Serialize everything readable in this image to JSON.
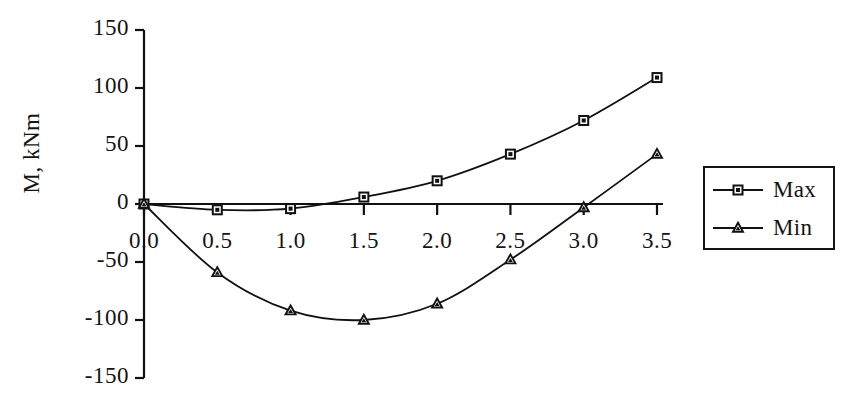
{
  "chart_data": {
    "type": "line",
    "title": "",
    "xlabel": "",
    "ylabel": "M, kNm",
    "x": [
      0.0,
      0.5,
      1.0,
      1.5,
      2.0,
      2.5,
      3.0,
      3.5
    ],
    "xtick_labels": [
      "0.0",
      "0.5",
      "1.0",
      "1.5",
      "2.0",
      "2.5",
      "3.0",
      "3.5"
    ],
    "ytick_labels": [
      "150",
      "100",
      "50",
      "0",
      "-50",
      "-100",
      "-150"
    ],
    "ytick_values": [
      150,
      100,
      50,
      0,
      -50,
      -100,
      -150
    ],
    "xlim": [
      0.0,
      3.5
    ],
    "ylim": [
      -150,
      150
    ],
    "grid": false,
    "legend_position": "right",
    "series": [
      {
        "name": "Max",
        "marker": "square",
        "color": "#111111",
        "values": [
          0,
          -5,
          -4,
          6,
          20,
          43,
          72,
          109
        ]
      },
      {
        "name": "Min",
        "marker": "triangle",
        "color": "#111111",
        "values": [
          0,
          -59,
          -92,
          -100,
          -86,
          -48,
          -3,
          43
        ]
      }
    ]
  },
  "axis": {
    "y_title": "M, kNm"
  },
  "legend": {
    "entries": [
      {
        "label": "Max",
        "marker": "square"
      },
      {
        "label": "Min",
        "marker": "triangle"
      }
    ]
  }
}
